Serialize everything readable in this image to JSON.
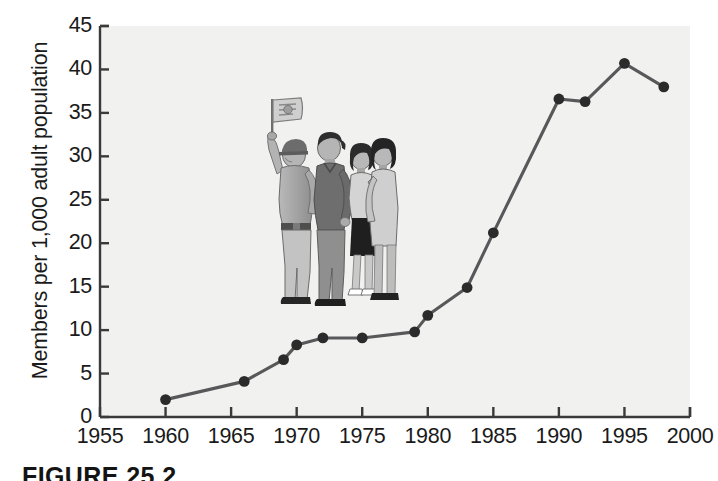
{
  "figure": {
    "caption": "FIGURE 25.2",
    "background_color": "#ffffff",
    "plot_background_color": "#f1f1f0"
  },
  "chart_data": {
    "type": "line",
    "title": "",
    "xlabel": "",
    "ylabel": "Members per 1,000 adult population",
    "xlim": [
      1955,
      2000
    ],
    "ylim": [
      0,
      45
    ],
    "grid": false,
    "legend": null,
    "line_color": "#58585a",
    "marker_color": "#2b2b2b",
    "marker_shape": "circle",
    "x_ticks": [
      1955,
      1960,
      1965,
      1970,
      1975,
      1980,
      1985,
      1990,
      1995,
      2000
    ],
    "y_ticks": [
      0,
      5,
      10,
      15,
      20,
      25,
      30,
      35,
      40,
      45
    ],
    "x": [
      1960,
      1966,
      1969,
      1970,
      1972,
      1975,
      1979,
      1980,
      1983,
      1985,
      1990,
      1992,
      1995,
      1998
    ],
    "values": [
      2.0,
      4.1,
      6.6,
      8.3,
      9.1,
      9.1,
      9.8,
      11.7,
      14.9,
      21.2,
      36.6,
      36.3,
      40.7,
      38.0
    ],
    "points": [
      {
        "x": 1960,
        "y": 2.0
      },
      {
        "x": 1966,
        "y": 4.1
      },
      {
        "x": 1969,
        "y": 6.6
      },
      {
        "x": 1970,
        "y": 8.3
      },
      {
        "x": 1972,
        "y": 9.1
      },
      {
        "x": 1975,
        "y": 9.1
      },
      {
        "x": 1979,
        "y": 9.8
      },
      {
        "x": 1980,
        "y": 11.7
      },
      {
        "x": 1983,
        "y": 14.9
      },
      {
        "x": 1985,
        "y": 21.2
      },
      {
        "x": 1990,
        "y": 36.6
      },
      {
        "x": 1992,
        "y": 36.3
      },
      {
        "x": 1995,
        "y": 40.7
      },
      {
        "x": 1998,
        "y": 38.0
      }
    ]
  },
  "illustration": {
    "name": "four-people-with-flag",
    "description": "Grayscale drawing of four adults standing in line; the leftmost man wears a cap and raises a small flag."
  }
}
